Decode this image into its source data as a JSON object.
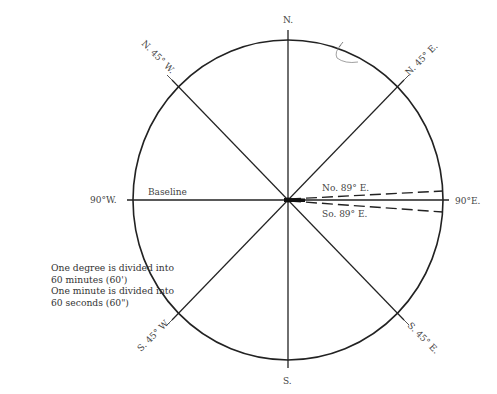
{
  "diagram": {
    "center": {
      "x": 288,
      "y": 200
    },
    "circle": {
      "rx": 155,
      "ry": 160
    },
    "labels": {
      "north": "N.",
      "south": "S.",
      "west": "90°W.",
      "east": "90°E.",
      "ne": "N. 45° E.",
      "nw": "N. 45° W.",
      "se": "S. 45° E.",
      "sw": "S. 45° W.",
      "baseline": "Baseline",
      "no89e": "No. 89° E.",
      "so89e": "So. 89° E."
    },
    "note": {
      "line1": "One degree is divided into",
      "line2": "60 minutes (60')",
      "line3": "One minute is divided into",
      "line4": "60 seconds (60\")"
    },
    "colors": {
      "line": "#222222",
      "text": "#444444",
      "sketch": "#888888"
    }
  }
}
